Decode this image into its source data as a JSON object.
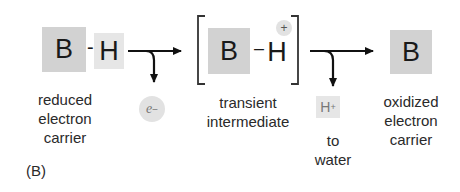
{
  "diagram": {
    "panel_label": "(B)",
    "reduced": {
      "B": "B",
      "bond": "-",
      "H": "H",
      "label_lines": [
        "reduced",
        "electron",
        "carrier"
      ]
    },
    "electron": {
      "symbol": "e",
      "charge": "−"
    },
    "intermediate": {
      "B": "B",
      "bond": "–",
      "H": "H",
      "charge": "+",
      "label_lines": [
        "transient",
        "intermediate"
      ]
    },
    "proton": {
      "symbol": "H",
      "charge": "+",
      "label_lines": [
        "to",
        "water"
      ]
    },
    "oxidized": {
      "B": "B",
      "label_lines": [
        "oxidized",
        "electron",
        "carrier"
      ]
    },
    "colors": {
      "B_box": "#d2d2d2",
      "H_box": "#e6e6e6",
      "circle": "#e2e2e2",
      "arrow": "#111111"
    }
  }
}
